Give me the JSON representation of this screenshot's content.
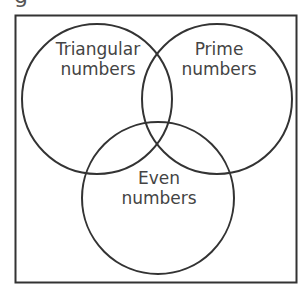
{
  "header": {
    "clipped_glyph": "g"
  },
  "diagram": {
    "type": "venn",
    "colors": {
      "stroke": "#333333",
      "text": "#444444",
      "background": "#ffffff"
    },
    "sets": [
      {
        "id": "triangular",
        "line1": "Triangular",
        "line2": "numbers"
      },
      {
        "id": "prime",
        "line1": "Prime",
        "line2": "numbers"
      },
      {
        "id": "even",
        "line1": "Even",
        "line2": "numbers"
      }
    ]
  }
}
